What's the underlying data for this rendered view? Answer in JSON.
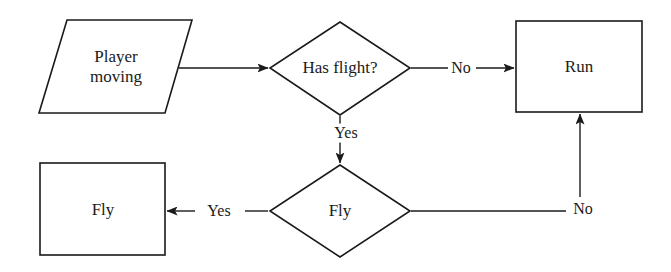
{
  "diagram": {
    "stroke_color": "#1a1a1a",
    "fill_color": "#ffffff",
    "background": "#ffffff",
    "nodes": {
      "player_moving": {
        "label": "Player\nmoving",
        "line1": "Player",
        "line2": "moving",
        "shape": "parallelogram"
      },
      "has_flight": {
        "label": "Has flight?",
        "shape": "diamond"
      },
      "run": {
        "label": "Run",
        "shape": "rectangle"
      },
      "fly_decision": {
        "label": "Fly",
        "shape": "diamond"
      },
      "fly_action": {
        "label": "Fly",
        "shape": "rectangle"
      }
    },
    "edges": {
      "start_to_has_flight": {
        "label": ""
      },
      "has_flight_no": {
        "label": "No"
      },
      "has_flight_yes": {
        "label": "Yes"
      },
      "fly_yes": {
        "label": "Yes"
      },
      "fly_no": {
        "label": "No"
      }
    }
  }
}
